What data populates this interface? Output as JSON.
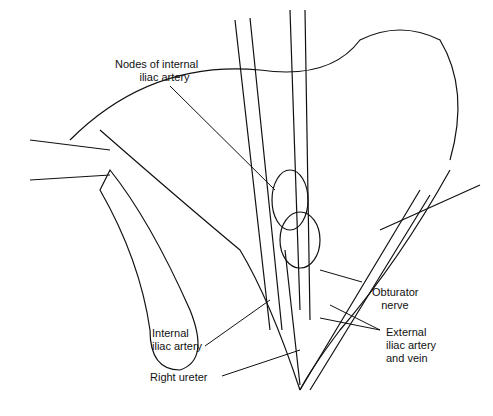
{
  "figure": {
    "type": "surgical anatomical illustration",
    "labels": {
      "nodes": "Nodes of internal\n        iliac artery",
      "internal_iliac": "Internal\niliac artery",
      "right_ureter": "Right ureter",
      "obturator": "Obturator\n   nerve",
      "external_iliac": "External\niliac artery\nand vein"
    }
  }
}
